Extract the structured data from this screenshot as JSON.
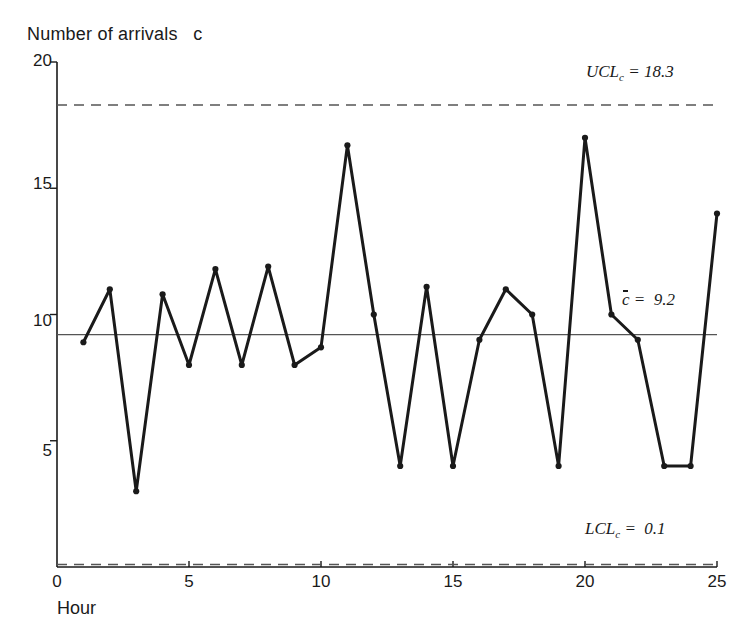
{
  "chart_data": {
    "type": "line",
    "title": "",
    "ylabel": "Number of arrivals   c",
    "xlabel": "Hour",
    "x": [
      1,
      2,
      3,
      4,
      5,
      6,
      7,
      8,
      9,
      10,
      11,
      12,
      13,
      14,
      15,
      16,
      17,
      18,
      19,
      20,
      21,
      22,
      23,
      24,
      25
    ],
    "values": [
      8.9,
      11,
      3,
      10.8,
      8,
      11.8,
      8,
      11.9,
      8,
      8.7,
      16.7,
      10,
      4,
      11.1,
      4,
      9,
      11,
      10,
      4,
      17,
      10,
      9,
      4,
      4,
      14
    ],
    "xlim": [
      0,
      25
    ],
    "ylim": [
      0,
      20
    ],
    "xticks": [
      0,
      5,
      10,
      15,
      20,
      25
    ],
    "yticks": [
      5,
      10,
      15,
      20
    ],
    "grid": false,
    "legend": "none",
    "series_name": "c",
    "marker": "dot",
    "line_color": "#1a1a1a",
    "control_limits": {
      "ucl": {
        "label_prefix": "UCL",
        "label_sub": "c",
        "label_eq": " = 18.3",
        "value": 18.3,
        "style": "dashed",
        "color": "#555555"
      },
      "center": {
        "label_prefix": "c",
        "label_eq": " =  9.2",
        "value": 9.2,
        "style": "solid",
        "color": "#555555"
      },
      "lcl": {
        "label_prefix": "LCL",
        "label_sub": "c",
        "label_eq": " =  0.1",
        "value": 0.1,
        "style": "dashed",
        "color": "#555555"
      }
    }
  },
  "axis": {
    "y_tick_labels": [
      "20",
      "15",
      "10",
      "5"
    ],
    "x_tick_labels": [
      "0",
      "5",
      "10",
      "15",
      "20",
      "25"
    ]
  }
}
